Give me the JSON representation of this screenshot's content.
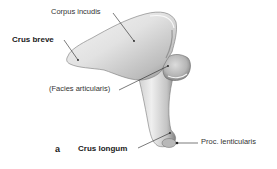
{
  "figure": {
    "panel_letter": "a",
    "labels": {
      "corpus_incudis": "Corpus incudis",
      "crus_breve": "Crus breve",
      "facies_articularis": "(Facies articularis)",
      "crus_longum": "Crus longum",
      "proc_lenticularis": "Proc. lenticularis"
    },
    "colors": {
      "background": "#ffffff",
      "bone_fill": "#e6e6e6",
      "bone_shadow": "#9a9a9a",
      "bone_outline": "#6f6f6f",
      "leader_line": "#222222",
      "text": "#1a1a1a"
    }
  }
}
